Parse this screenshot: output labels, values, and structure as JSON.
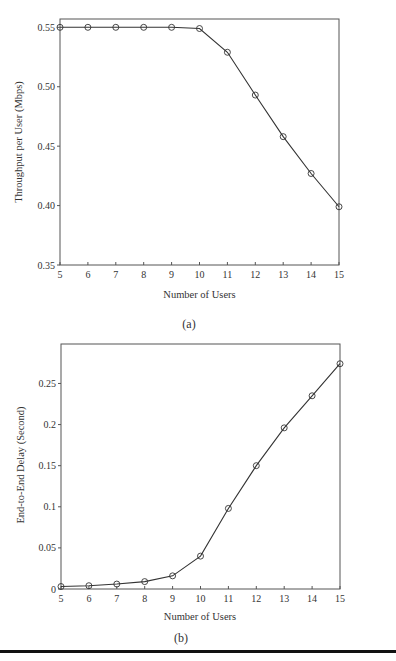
{
  "chart_data": [
    {
      "type": "line",
      "caption": "(a)",
      "title": "",
      "xlabel": "Number of Users",
      "ylabel": "Throughput per User (Mbps)",
      "x": [
        5,
        6,
        7,
        8,
        9,
        10,
        11,
        12,
        13,
        14,
        15
      ],
      "series": [
        {
          "name": "Throughput",
          "marker": "circle",
          "values": [
            0.55,
            0.55,
            0.55,
            0.55,
            0.55,
            0.549,
            0.529,
            0.493,
            0.458,
            0.427,
            0.399
          ]
        }
      ],
      "xlim": [
        5,
        15
      ],
      "ylim": [
        0.35,
        0.557
      ],
      "xticks": [
        5,
        6,
        7,
        8,
        9,
        10,
        11,
        12,
        13,
        14,
        15
      ],
      "xtick_labels": [
        "5",
        "6",
        "7",
        "8",
        "9",
        "10",
        "11",
        "12",
        "13",
        "14",
        "15"
      ],
      "yticks": [
        0.35,
        0.4,
        0.45,
        0.5,
        0.55
      ],
      "ytick_labels": [
        "0.35",
        "0.40",
        "0.45",
        "0.50",
        "0.55"
      ],
      "grid": false,
      "legend": "none"
    },
    {
      "type": "line",
      "caption": "(b)",
      "title": "",
      "xlabel": "Number of Users",
      "ylabel": "End-to-End Delay (Second)",
      "x": [
        5,
        6,
        7,
        8,
        9,
        10,
        11,
        12,
        13,
        14,
        15
      ],
      "series": [
        {
          "name": "Delay",
          "marker": "circle",
          "values": [
            0.003,
            0.004,
            0.006,
            0.009,
            0.016,
            0.04,
            0.098,
            0.15,
            0.196,
            0.235,
            0.274
          ]
        }
      ],
      "xlim": [
        5,
        15
      ],
      "ylim": [
        0,
        0.3
      ],
      "xticks": [
        5,
        6,
        7,
        8,
        9,
        10,
        11,
        12,
        13,
        14,
        15
      ],
      "xtick_labels": [
        "5",
        "6",
        "7",
        "8",
        "9",
        "10",
        "11",
        "12",
        "13",
        "14",
        "15"
      ],
      "yticks": [
        0,
        0.05,
        0.1,
        0.15,
        0.2,
        0.25
      ],
      "ytick_labels": [
        "0",
        "0.05",
        "0.1",
        "0.15",
        "0.2",
        "0.25"
      ],
      "grid": false,
      "legend": "none"
    }
  ]
}
